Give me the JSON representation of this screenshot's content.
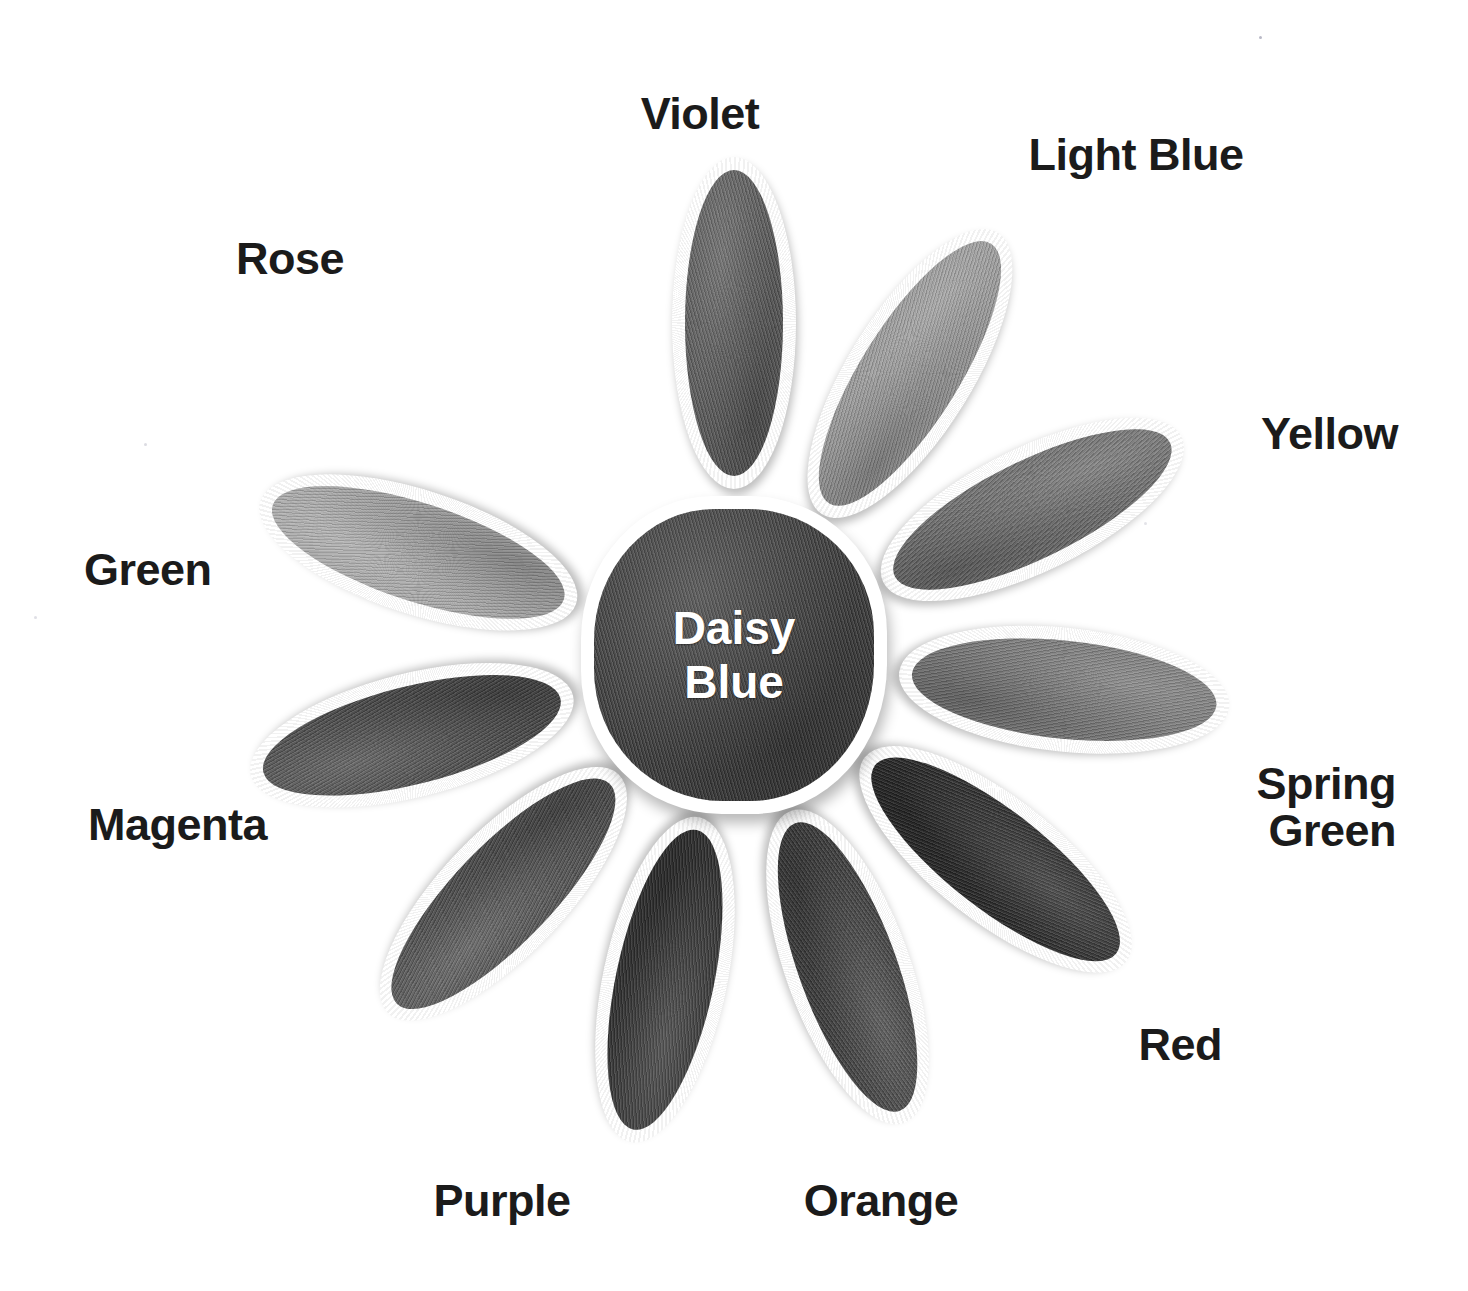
{
  "page": {
    "background_color": "#ffffff",
    "width": 1468,
    "height": 1291
  },
  "center": {
    "name": "daisy-center",
    "label": "Daisy\nBlue",
    "label_color": "#ffffff",
    "fill_color": "#3a3a3a",
    "border_color": "#ffffff"
  },
  "petals": [
    {
      "name": "violet",
      "label": "Violet",
      "fill_color": "#5a5a5a",
      "angle": 0,
      "label_x": 700,
      "label_y": 90,
      "label_align": "ctr"
    },
    {
      "name": "light-blue",
      "label": "Light Blue",
      "fill_color": "#9a9a9a",
      "angle": 32,
      "label_x": 1136,
      "label_y": 131,
      "label_align": "ctr"
    },
    {
      "name": "yellow",
      "label": "Yellow",
      "fill_color": "#6e6e6e",
      "angle": 64,
      "label_x": 1398,
      "label_y": 410,
      "label_align": "rgt"
    },
    {
      "name": "spring-green",
      "label": "Spring\nGreen",
      "fill_color": "#7a7a7a",
      "angle": 96,
      "label_x": 1396,
      "label_y": 760,
      "label_align": "rgt"
    },
    {
      "name": "red",
      "label": "Red",
      "fill_color": "#2a2a2a",
      "angle": 128,
      "label_x": 1222,
      "label_y": 1021,
      "label_align": "rgt"
    },
    {
      "name": "orange",
      "label": "Orange",
      "fill_color": "#3f3f3f",
      "angle": 160,
      "label_x": 881,
      "label_y": 1177,
      "label_align": "ctr"
    },
    {
      "name": "purple",
      "label": "Purple",
      "fill_color": "#333333",
      "angle": 192,
      "label_x": 502,
      "label_y": 1177,
      "label_align": "ctr"
    },
    {
      "name": "magenta",
      "label": "Magenta",
      "fill_color": "#505050",
      "angle": 224,
      "label_x": 88,
      "label_y": 801,
      "label_align": "lft"
    },
    {
      "name": "green",
      "label": "Green",
      "fill_color": "#4a4a4a",
      "angle": 256,
      "label_x": 84,
      "label_y": 546,
      "label_align": "lft"
    },
    {
      "name": "rose",
      "label": "Rose",
      "fill_color": "#a8a8a8",
      "angle": 288,
      "label_x": 290,
      "label_y": 235,
      "label_align": "ctr"
    }
  ],
  "geometry": {
    "center_x": 734,
    "center_y": 655,
    "petal_offset": 166,
    "petal_width": 124,
    "petal_height": 332,
    "petal_border": 13
  }
}
